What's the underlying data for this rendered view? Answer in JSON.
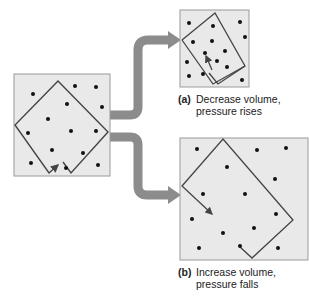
{
  "figure": {
    "colors": {
      "box_fill": "#e9e9e9",
      "box_stroke": "#9a9a9a",
      "container_stroke": "#444444",
      "arrow": "#8c8c8c",
      "particle": "#111111"
    },
    "panels": {
      "initial": {
        "label": ""
      },
      "a": {
        "tag": "(a)",
        "line1": "Decrease volume,",
        "line2": "pressure rises"
      },
      "b": {
        "tag": "(b)",
        "line1": "Increase volume,",
        "line2": "pressure falls"
      }
    }
  }
}
